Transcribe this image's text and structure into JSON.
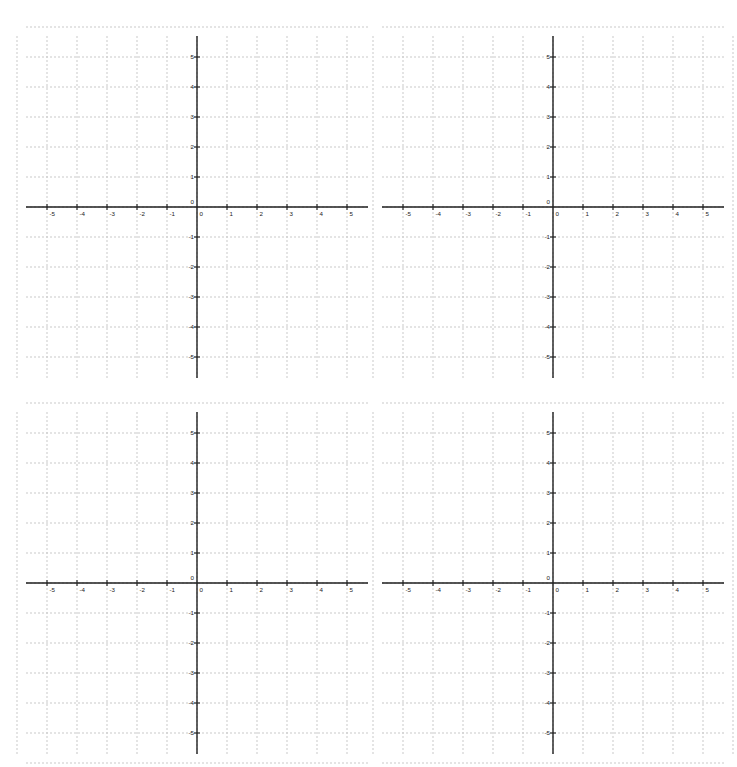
{
  "page": {
    "background_color": "#ffffff",
    "width": 737,
    "height": 767,
    "layout": "2x2 grid of blank Cartesian coordinate planes"
  },
  "style": {
    "grid_line_color": "#c9c9c9",
    "axis_color": "#1f1f1f",
    "tick_label_color": "#1a1a1a",
    "grid_dash": "2 2",
    "unit_px": 30
  },
  "chart_data": [
    {
      "id": "graph-top-left",
      "type": "scatter",
      "title": "",
      "subtitle": "",
      "xlabel": "",
      "ylabel": "",
      "xlim": [
        -5.7,
        5.7
      ],
      "ylim": [
        -5.7,
        5.7
      ],
      "xticks": [
        -5,
        -4,
        -3,
        -2,
        -1,
        0,
        1,
        2,
        3,
        4,
        5
      ],
      "yticks": [
        -5,
        -4,
        -3,
        -2,
        -1,
        0,
        1,
        2,
        3,
        4,
        5
      ],
      "xtick_labels": [
        "-5",
        "-4",
        "-3",
        "-2",
        "-1",
        "0",
        "1",
        "2",
        "3",
        "4",
        "5"
      ],
      "ytick_labels": [
        "-5",
        "-4",
        "-3",
        "-2",
        "-1",
        "0",
        "1",
        "2",
        "3",
        "4",
        "5"
      ],
      "origin_label": "0",
      "grid": true,
      "legend": false,
      "series": [
        {
          "name": "",
          "x": [],
          "y": []
        }
      ]
    },
    {
      "id": "graph-top-right",
      "type": "scatter",
      "title": "",
      "subtitle": "",
      "xlabel": "",
      "ylabel": "",
      "xlim": [
        -5.7,
        5.7
      ],
      "ylim": [
        -5.7,
        5.7
      ],
      "xticks": [
        -5,
        -4,
        -3,
        -2,
        -1,
        0,
        1,
        2,
        3,
        4,
        5
      ],
      "yticks": [
        -5,
        -4,
        -3,
        -2,
        -1,
        0,
        1,
        2,
        3,
        4,
        5
      ],
      "xtick_labels": [
        "-5",
        "-4",
        "-3",
        "-2",
        "-1",
        "0",
        "1",
        "2",
        "3",
        "4",
        "5"
      ],
      "ytick_labels": [
        "-5",
        "-4",
        "-3",
        "-2",
        "-1",
        "0",
        "1",
        "2",
        "3",
        "4",
        "5"
      ],
      "origin_label": "0",
      "grid": true,
      "legend": false,
      "series": [
        {
          "name": "",
          "x": [],
          "y": []
        }
      ]
    },
    {
      "id": "graph-bottom-left",
      "type": "scatter",
      "title": "",
      "subtitle": "",
      "xlabel": "",
      "ylabel": "",
      "xlim": [
        -5.7,
        5.7
      ],
      "ylim": [
        -5.7,
        5.7
      ],
      "xticks": [
        -5,
        -4,
        -3,
        -2,
        -1,
        0,
        1,
        2,
        3,
        4,
        5
      ],
      "yticks": [
        -5,
        -4,
        -3,
        -2,
        -1,
        0,
        1,
        2,
        3,
        4,
        5
      ],
      "xtick_labels": [
        "-5",
        "-4",
        "-3",
        "-2",
        "-1",
        "0",
        "1",
        "2",
        "3",
        "4",
        "5"
      ],
      "ytick_labels": [
        "-5",
        "-4",
        "-3",
        "-2",
        "-1",
        "0",
        "1",
        "2",
        "3",
        "4",
        "5"
      ],
      "origin_label": "0",
      "grid": true,
      "legend": false,
      "series": [
        {
          "name": "",
          "x": [],
          "y": []
        }
      ]
    },
    {
      "id": "graph-bottom-right",
      "type": "scatter",
      "title": "",
      "subtitle": "",
      "xlabel": "",
      "ylabel": "",
      "xlim": [
        -5.7,
        5.7
      ],
      "ylim": [
        -5.7,
        5.7
      ],
      "xticks": [
        -5,
        -4,
        -3,
        -2,
        -1,
        0,
        1,
        2,
        3,
        4,
        5
      ],
      "yticks": [
        -5,
        -4,
        -3,
        -2,
        -1,
        0,
        1,
        2,
        3,
        4,
        5
      ],
      "xtick_labels": [
        "-5",
        "-4",
        "-3",
        "-2",
        "-1",
        "0",
        "1",
        "2",
        "3",
        "4",
        "5"
      ],
      "ytick_labels": [
        "-5",
        "-4",
        "-3",
        "-2",
        "-1",
        "0",
        "1",
        "2",
        "3",
        "4",
        "5"
      ],
      "origin_label": "0",
      "grid": true,
      "legend": false,
      "series": [
        {
          "name": "",
          "x": [],
          "y": []
        }
      ]
    }
  ]
}
